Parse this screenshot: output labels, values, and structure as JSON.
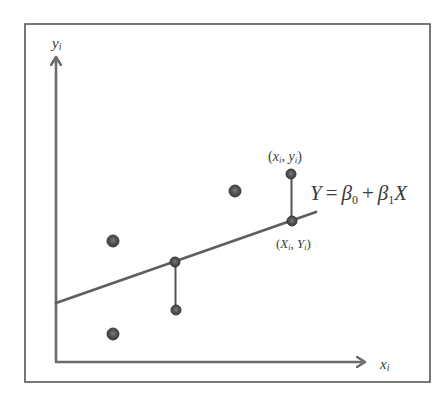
{
  "diagram": {
    "type": "linear-regression-illustration",
    "colors": {
      "frame": "#555555",
      "axis": "#6b6b6b",
      "line": "#5f5f5f",
      "point": "#4a4a4a",
      "point_highlight": "#7a7a7a",
      "text": "#3a3a3a"
    },
    "axes": {
      "y_label": "y",
      "y_label_sub": "i",
      "x_label": "x",
      "x_label_sub": "i"
    },
    "equation": {
      "lhs": "Y",
      "eq": "=",
      "beta0": "β",
      "beta0_sub": "0",
      "plus": "+",
      "beta1": "β",
      "beta1_sub": "1",
      "var": "X"
    },
    "labels": {
      "observed_point": {
        "open": "(",
        "x": "x",
        "x_sub": "i",
        "sep": ", ",
        "y": "y",
        "y_sub": "i",
        "close": ")"
      },
      "fitted_point": {
        "open": "(",
        "x": "X",
        "x_sub": "i",
        "sep": ", ",
        "y": "Y",
        "y_sub": "i",
        "close": ")"
      }
    },
    "regression_line": {
      "x1": 56,
      "y1": 303,
      "x2": 316,
      "y2": 212
    },
    "points": [
      {
        "name": "data-point-upper-left",
        "cx": 113,
        "cy": 241,
        "r": 6
      },
      {
        "name": "data-point-lower-left",
        "cx": 113,
        "cy": 334,
        "r": 6
      },
      {
        "name": "data-point-upper-middle",
        "cx": 235,
        "cy": 191,
        "r": 6
      },
      {
        "name": "fitted-point-middle",
        "cx": 175,
        "cy": 262,
        "r": 5
      },
      {
        "name": "observed-point-middle",
        "cx": 176,
        "cy": 310,
        "r": 5
      },
      {
        "name": "observed-point-xi-yi",
        "cx": 291,
        "cy": 174,
        "r": 5
      },
      {
        "name": "fitted-point-Xi-Yi",
        "cx": 292,
        "cy": 221,
        "r": 5
      }
    ],
    "residuals": [
      {
        "name": "residual-middle",
        "x": 175.5,
        "y1": 262,
        "y2": 310
      },
      {
        "name": "residual-right",
        "x": 291.5,
        "y1": 174,
        "y2": 221
      }
    ]
  }
}
